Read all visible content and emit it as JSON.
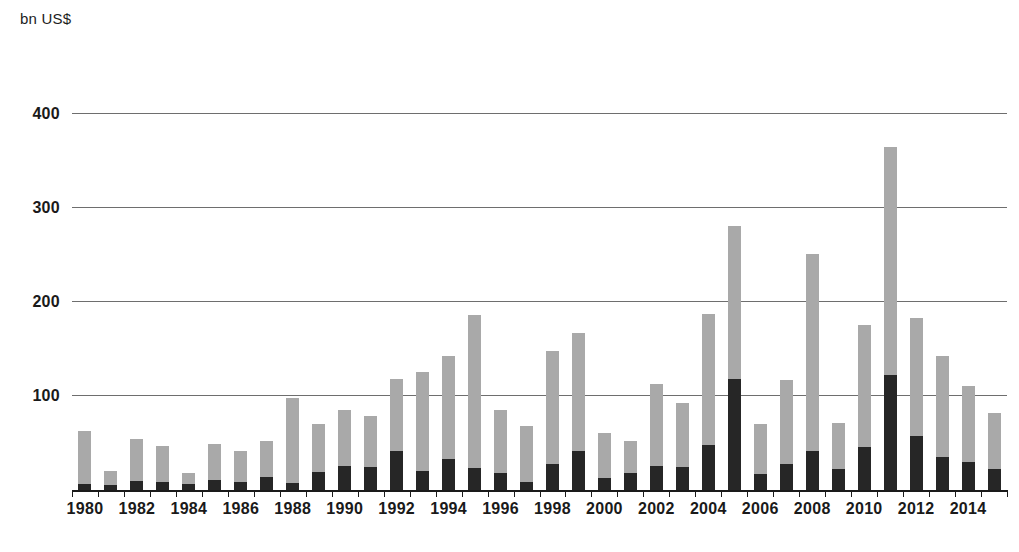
{
  "axis": {
    "unit_label": "bn US$",
    "y_ticks": [
      100,
      200,
      300,
      400
    ],
    "y_min": 0,
    "y_max": 420,
    "x_tick_labels": [
      "1980",
      "1982",
      "1984",
      "1986",
      "1988",
      "1990",
      "1992",
      "1994",
      "1996",
      "1998",
      "2000",
      "2002",
      "2004",
      "2006",
      "2008",
      "2010",
      "2012",
      "2014"
    ]
  },
  "colors": {
    "light_segment": "#a9a9a9",
    "dark_segment": "#262626",
    "gridline": "#6e6e6e",
    "axis": "#1a1a1a",
    "background": "#ffffff"
  },
  "chart_data": {
    "type": "bar",
    "title": "",
    "subtitle": "",
    "xlabel": "",
    "ylabel": "bn US$",
    "ylim": [
      0,
      420
    ],
    "grid": true,
    "legend_position": "none",
    "stacked": true,
    "categories": [
      "1980",
      "1981",
      "1982",
      "1983",
      "1984",
      "1985",
      "1986",
      "1987",
      "1988",
      "1989",
      "1990",
      "1991",
      "1992",
      "1993",
      "1994",
      "1995",
      "1996",
      "1997",
      "1998",
      "1999",
      "2000",
      "2001",
      "2002",
      "2003",
      "2004",
      "2005",
      "2006",
      "2007",
      "2008",
      "2009",
      "2010",
      "2011",
      "2012",
      "2013",
      "2014",
      "2015"
    ],
    "series": [
      {
        "name": "dark-segment",
        "color": "#262626",
        "values": [
          6,
          5,
          10,
          9,
          6,
          11,
          9,
          14,
          7,
          19,
          26,
          24,
          41,
          20,
          33,
          23,
          18,
          9,
          28,
          41,
          13,
          18,
          26,
          25,
          48,
          118,
          17,
          28,
          42,
          22,
          46,
          122,
          57,
          35,
          30,
          22
        ]
      },
      {
        "name": "light-segment",
        "color": "#a9a9a9",
        "values": [
          57,
          15,
          44,
          38,
          12,
          38,
          33,
          38,
          91,
          51,
          59,
          55,
          77,
          105,
          109,
          163,
          67,
          59,
          120,
          126,
          48,
          34,
          87,
          68,
          139,
          163,
          53,
          89,
          209,
          49,
          130,
          243,
          126,
          107,
          81,
          60
        ]
      }
    ],
    "totals": [
      63,
      20,
      54,
      47,
      18,
      49,
      42,
      52,
      98,
      70,
      85,
      79,
      118,
      125,
      142,
      186,
      85,
      68,
      148,
      167,
      61,
      52,
      113,
      93,
      187,
      281,
      70,
      117,
      251,
      71,
      176,
      365,
      183,
      142,
      111,
      82
    ]
  }
}
